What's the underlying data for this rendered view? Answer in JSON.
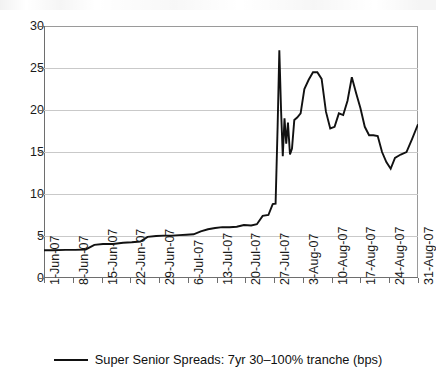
{
  "chart_data": {
    "type": "line",
    "title": "",
    "subtitle": "",
    "xlabel": "",
    "ylabel": "",
    "ylim": [
      0,
      30
    ],
    "yticks": [
      0,
      5,
      10,
      15,
      20,
      25,
      30
    ],
    "ytick_labels": [
      "0",
      "5",
      "10",
      "15",
      "20",
      "25",
      "30"
    ],
    "grid": true,
    "grid_axis": "y",
    "legend_position": "bottom-center",
    "categories": [
      "1-Jun-07",
      "8-Jun-07",
      "15-Jun-07",
      "22-Jun-07",
      "29-Jun-07",
      "6-Jul-07",
      "13-Jul-07",
      "20-Jul-07",
      "27-Jul-07",
      "3-Aug-07",
      "10-Aug-07",
      "17-Aug-07",
      "24-Aug-07",
      "31-Aug-07"
    ],
    "series": [
      {
        "name": "Super Senior Spreads: 7yr 30–100% tranche (bps)",
        "color": "#111111",
        "x": [
          0.0,
          0.3,
          0.75,
          1.1,
          1.45,
          1.75,
          2.05,
          2.4,
          2.75,
          3.05,
          3.35,
          3.6,
          3.9,
          4.15,
          4.45,
          4.7,
          4.95,
          5.2,
          5.45,
          5.7,
          5.95,
          6.2,
          6.45,
          6.7,
          6.95,
          7.2,
          7.4,
          7.6,
          7.8,
          7.95,
          8.05,
          8.12,
          8.18,
          8.24,
          8.3,
          8.36,
          8.42,
          8.48,
          8.55,
          8.62,
          8.7,
          8.8,
          8.92,
          9.05,
          9.2,
          9.35,
          9.5,
          9.65,
          9.8,
          9.95,
          10.1,
          10.25,
          10.4,
          10.55,
          10.7,
          10.85,
          11.0,
          11.15,
          11.3,
          11.45,
          11.6,
          11.75,
          11.9,
          12.05,
          12.2,
          12.4,
          12.6,
          12.8,
          13.0
        ],
        "values": [
          3.3,
          3.3,
          3.35,
          3.35,
          3.4,
          3.95,
          4.05,
          4.05,
          4.2,
          4.25,
          4.35,
          4.9,
          5.0,
          5.05,
          5.05,
          5.1,
          5.15,
          5.2,
          5.55,
          5.8,
          5.95,
          6.05,
          6.05,
          6.1,
          6.3,
          6.25,
          6.4,
          7.4,
          7.5,
          8.8,
          8.85,
          18.0,
          27.1,
          20.0,
          14.5,
          19.0,
          16.0,
          18.5,
          14.7,
          15.4,
          18.8,
          19.1,
          19.6,
          22.5,
          23.6,
          24.5,
          24.5,
          23.7,
          19.8,
          17.8,
          18.0,
          19.6,
          19.4,
          21.1,
          23.9,
          22.0,
          20.2,
          18.0,
          17.0,
          17.0,
          16.9,
          15.0,
          13.8,
          13.0,
          14.3,
          14.7,
          15.0,
          16.6,
          18.3
        ]
      }
    ],
    "legend": [
      {
        "label": "Super Senior Spreads: 7yr 30–100% tranche (bps)",
        "marker": "line",
        "color": "#111111"
      }
    ],
    "annotations": [],
    "notes": {
      "peak_value": 27.1,
      "peak_date": "27-Jul-07",
      "start_value": 3.3,
      "end_value": 18.3,
      "min_value": 3.3
    }
  },
  "axes": {
    "y_axis_name": "spread-axis",
    "x_axis_name": "date-axis"
  }
}
